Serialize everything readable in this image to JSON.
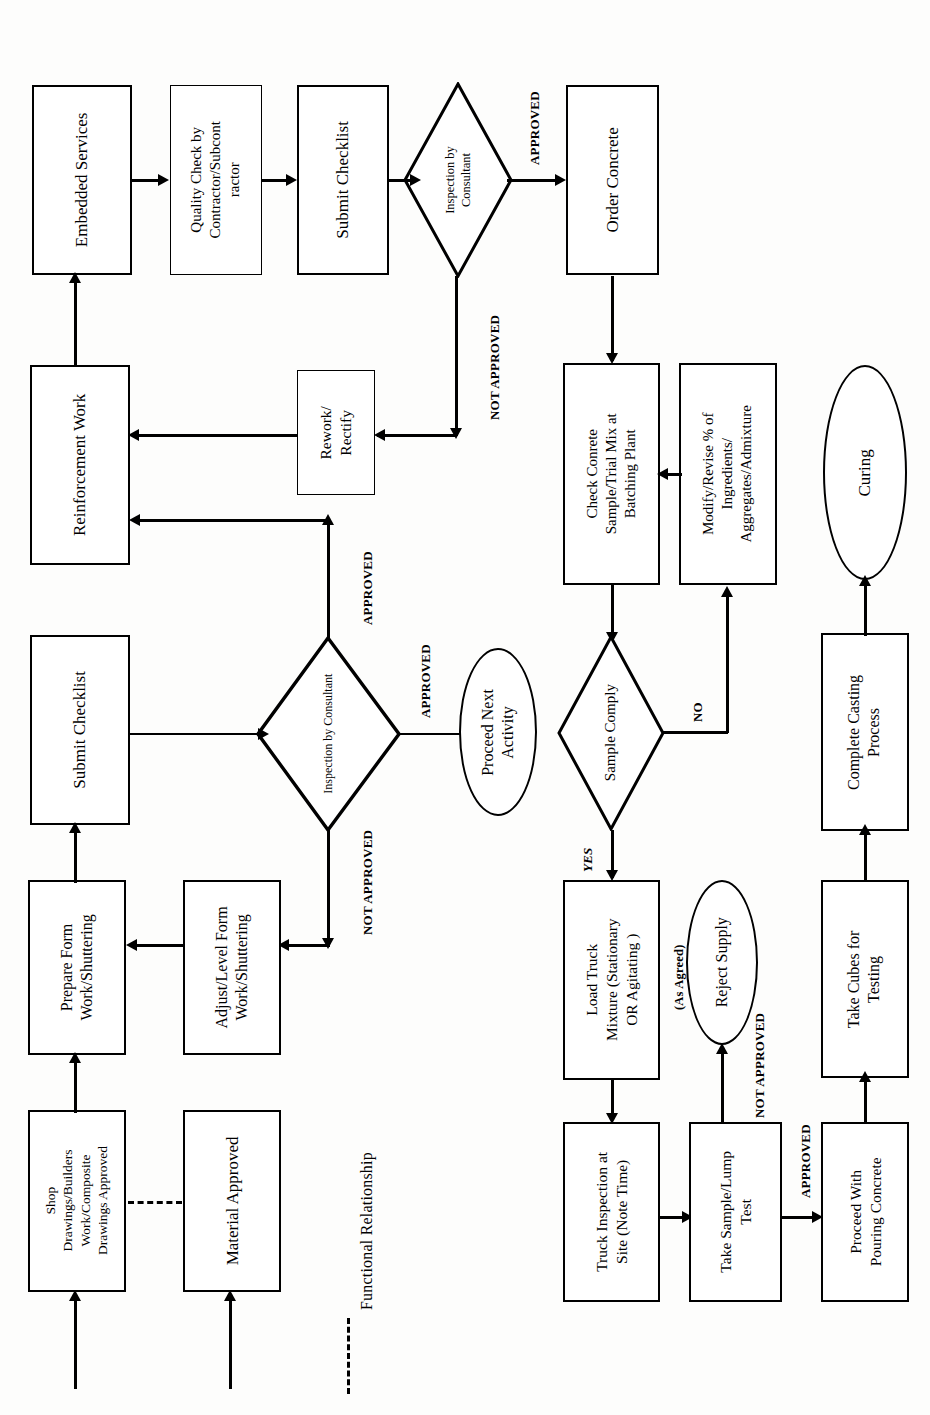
{
  "diagram": {
    "orientation": "rotated-90",
    "legend": {
      "dashed_line_label": "Functional Relationship"
    },
    "nodes": [
      {
        "id": "embedded_services",
        "shape": "process",
        "label": "Embedded Services"
      },
      {
        "id": "quality_check",
        "shape": "process",
        "label": "Quality Check by\nContractor/Subcont\nractor"
      },
      {
        "id": "submit_checklist_1",
        "shape": "process",
        "label": "Submit Checklist"
      },
      {
        "id": "inspection_1",
        "shape": "decision",
        "label": "Inspection by\nConsultant"
      },
      {
        "id": "order_concrete",
        "shape": "process",
        "label": "Order Concrete"
      },
      {
        "id": "reinforcement_work",
        "shape": "process",
        "label": "Reinforcement Work"
      },
      {
        "id": "rework_rectify",
        "shape": "process",
        "label": "Rework/\nRectify"
      },
      {
        "id": "check_concrete",
        "shape": "process",
        "label": "Check Conrete\nSample/Trial Mix at\nBatching Plant"
      },
      {
        "id": "modify_revise",
        "shape": "process",
        "label": "Modify/Revise % of\nIngredients/\nAggregates/Admixture"
      },
      {
        "id": "curing",
        "shape": "terminator",
        "label": "Curing"
      },
      {
        "id": "submit_checklist_2",
        "shape": "process",
        "label": "Submit Checklist"
      },
      {
        "id": "inspection_2",
        "shape": "decision",
        "label": "Inspection by Consultant"
      },
      {
        "id": "proceed_next",
        "shape": "terminator",
        "label": "Proceed Next\nActivity"
      },
      {
        "id": "sample_comply",
        "shape": "decision",
        "label": "Sample Comply"
      },
      {
        "id": "complete_casting",
        "shape": "process",
        "label": "Complete Casting\nProcess"
      },
      {
        "id": "prepare_form",
        "shape": "process",
        "label": "Prepare Form\nWork/Shuttering"
      },
      {
        "id": "adjust_level_form",
        "shape": "process",
        "label": "Adjust/Level Form\nWork/Shuttering"
      },
      {
        "id": "load_truck",
        "shape": "process",
        "label": "Load Truck\nMixture (Stationary\nOR Agitating )"
      },
      {
        "id": "load_truck_note",
        "shape": "note",
        "label": "(As Agreed)"
      },
      {
        "id": "reject_supply",
        "shape": "terminator",
        "label": "Reject Supply"
      },
      {
        "id": "take_cubes",
        "shape": "process",
        "label": "Take Cubes for\nTesting"
      },
      {
        "id": "shop_drawings",
        "shape": "process",
        "label": "Shop\nDrawings/Builders\nWork/Composite\nDrawings Approved"
      },
      {
        "id": "material_approved",
        "shape": "process",
        "label": "Material Approved"
      },
      {
        "id": "truck_inspection",
        "shape": "process",
        "label": "Truck Inspection at\nSite (Note Time)"
      },
      {
        "id": "take_sample_lump",
        "shape": "process",
        "label": "Take Sample/Lump\nTest"
      },
      {
        "id": "proceed_pouring",
        "shape": "process",
        "label": "Proceed With\nPouring Concrete"
      }
    ],
    "edge_labels": {
      "approved_1": "APPROVED",
      "not_approved_1": "NOT APPROVED",
      "approved_2": "APPROVED",
      "approved_3": "APPROVED",
      "not_approved_2": "NOT APPROVED",
      "yes": "YES",
      "no": "NO",
      "not_approved_3": "NOT APPROVED",
      "approved_4": "APPROVED"
    },
    "edges": [
      {
        "from": "embedded_services",
        "to": "quality_check",
        "label": ""
      },
      {
        "from": "quality_check",
        "to": "submit_checklist_1",
        "label": ""
      },
      {
        "from": "submit_checklist_1",
        "to": "inspection_1",
        "label": ""
      },
      {
        "from": "inspection_1",
        "to": "order_concrete",
        "label": "APPROVED"
      },
      {
        "from": "inspection_1",
        "to": "rework_rectify",
        "label": "NOT APPROVED"
      },
      {
        "from": "rework_rectify",
        "to": "reinforcement_work",
        "label": ""
      },
      {
        "from": "reinforcement_work",
        "to": "embedded_services",
        "label": ""
      },
      {
        "from": "inspection_2",
        "to": "reinforcement_work",
        "label": "APPROVED"
      },
      {
        "from": "submit_checklist_2",
        "to": "inspection_2",
        "label": ""
      },
      {
        "from": "inspection_2",
        "to": "proceed_next",
        "label": "APPROVED"
      },
      {
        "from": "inspection_2",
        "to": "adjust_level_form",
        "label": "NOT APPROVED"
      },
      {
        "from": "adjust_level_form",
        "to": "prepare_form",
        "label": ""
      },
      {
        "from": "prepare_form",
        "to": "submit_checklist_2",
        "label": ""
      },
      {
        "from": "shop_drawings",
        "to": "prepare_form",
        "label": ""
      },
      {
        "from": "shop_drawings",
        "to": "material_approved",
        "label": "Functional Relationship"
      },
      {
        "from": "order_concrete",
        "to": "check_concrete",
        "label": ""
      },
      {
        "from": "check_concrete",
        "to": "sample_comply",
        "label": ""
      },
      {
        "from": "sample_comply",
        "to": "load_truck",
        "label": "YES"
      },
      {
        "from": "sample_comply",
        "to": "modify_revise",
        "label": "NO"
      },
      {
        "from": "modify_revise",
        "to": "check_concrete",
        "label": ""
      },
      {
        "from": "load_truck",
        "to": "truck_inspection",
        "label": ""
      },
      {
        "from": "truck_inspection",
        "to": "take_sample_lump",
        "label": ""
      },
      {
        "from": "take_sample_lump",
        "to": "reject_supply",
        "label": "NOT APPROVED"
      },
      {
        "from": "take_sample_lump",
        "to": "proceed_pouring",
        "label": "APPROVED"
      },
      {
        "from": "proceed_pouring",
        "to": "take_cubes",
        "label": ""
      },
      {
        "from": "take_cubes",
        "to": "complete_casting",
        "label": ""
      },
      {
        "from": "complete_casting",
        "to": "curing",
        "label": ""
      }
    ]
  }
}
